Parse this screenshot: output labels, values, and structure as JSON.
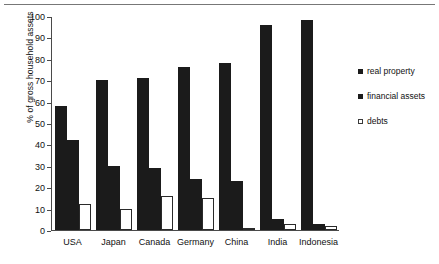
{
  "chart_data": {
    "type": "bar",
    "title": "",
    "xlabel": "",
    "ylabel": "% of gross household assets",
    "ylim": [
      0,
      100
    ],
    "yticks": [
      0,
      10,
      20,
      30,
      40,
      50,
      60,
      70,
      80,
      90,
      100
    ],
    "grid": false,
    "legend_position": "right",
    "categories": [
      "USA",
      "Japan",
      "Canada",
      "Germany",
      "China",
      "India",
      "Indonesia"
    ],
    "series": [
      {
        "name": "real property",
        "style": "solid",
        "color": "#1b1b1b",
        "values": [
          58,
          70,
          71,
          76,
          78,
          96,
          98
        ]
      },
      {
        "name": "financial assets",
        "style": "solid",
        "color": "#1b1b1b",
        "values": [
          42,
          30,
          29,
          24,
          23,
          5,
          3
        ]
      },
      {
        "name": "debts",
        "style": "open",
        "color": "#ffffff",
        "values": [
          12,
          10,
          16,
          15,
          1,
          3,
          2
        ]
      }
    ]
  }
}
